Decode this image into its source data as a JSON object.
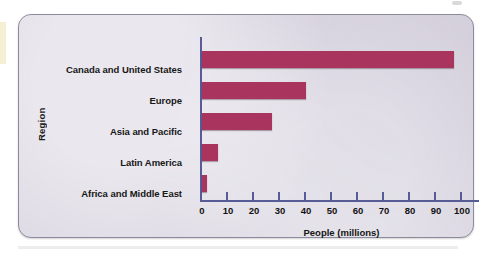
{
  "panel": {
    "background_color": "#dcd8e3",
    "border_color": "#8d8a9c"
  },
  "chart_data": {
    "type": "bar",
    "orientation": "horizontal",
    "title": "",
    "xlabel": "People (millions)",
    "ylabel": "Region",
    "xlim": [
      0,
      100
    ],
    "xticks": [
      0,
      10,
      20,
      30,
      40,
      50,
      60,
      70,
      80,
      90,
      100
    ],
    "xtick_labels": [
      "0",
      "10",
      "20",
      "30",
      "40",
      "50",
      "60",
      "70",
      "80",
      "90",
      "100"
    ],
    "grid": false,
    "legend": "none",
    "bar_color": "#a9355f",
    "axis_color": "#575b96",
    "categories": [
      "Canada and United States",
      "Europe",
      "Asia and Pacific",
      "Latin America",
      "Africa and Middle East"
    ],
    "values": [
      97,
      40,
      27,
      6,
      2
    ]
  }
}
